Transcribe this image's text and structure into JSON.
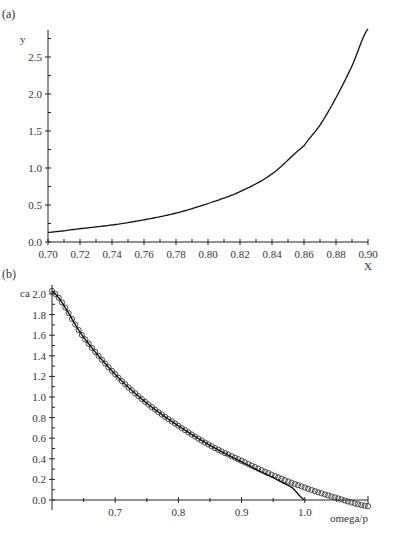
{
  "chart_data": [
    {
      "panel": "(a)",
      "type": "line",
      "title": "",
      "xlabel": "X",
      "ylabel": "y",
      "xlim": [
        0.7,
        0.9
      ],
      "ylim": [
        0.0,
        2.9
      ],
      "xticks": [
        "0.70",
        "0.72",
        "0.74",
        "0.76",
        "0.78",
        "0.80",
        "0.82",
        "0.84",
        "0.86",
        "0.88",
        "0.90"
      ],
      "yticks": [
        "0.0",
        "0.5",
        "1.0",
        "1.5",
        "2.0",
        "2.5"
      ],
      "grid": false,
      "series": [
        {
          "name": "y(X)",
          "style": "solid",
          "x": [
            0.7,
            0.72,
            0.74,
            0.76,
            0.78,
            0.8,
            0.82,
            0.84,
            0.86,
            0.87,
            0.88,
            0.89,
            0.9
          ],
          "values": [
            0.13,
            0.18,
            0.23,
            0.3,
            0.39,
            0.52,
            0.68,
            0.92,
            1.3,
            1.58,
            1.95,
            2.38,
            2.88
          ]
        }
      ]
    },
    {
      "panel": "(b)",
      "type": "line",
      "title": "",
      "xlabel": "omega/p",
      "ylabel": "ca",
      "xlim": [
        0.6,
        1.1
      ],
      "ylim": [
        0.0,
        2.0
      ],
      "xticks": [
        "0.7",
        "0.8",
        "0.9",
        "1.0"
      ],
      "yticks": [
        "0.0",
        "0.2",
        "0.4",
        "0.6",
        "0.8",
        "1.0",
        "1.2",
        "1.4",
        "1.6",
        "1.8",
        "2.0"
      ],
      "grid": false,
      "series": [
        {
          "name": "solid curve",
          "style": "solid",
          "x": [
            0.6,
            0.65,
            0.7,
            0.75,
            0.8,
            0.85,
            0.9,
            0.95,
            0.98,
            1.0
          ],
          "values": [
            2.03,
            1.58,
            1.22,
            0.94,
            0.72,
            0.53,
            0.37,
            0.22,
            0.12,
            0.0
          ]
        },
        {
          "name": "circles",
          "style": "markers-circle",
          "x": [
            0.6,
            0.65,
            0.7,
            0.75,
            0.8,
            0.85,
            0.9,
            0.95,
            1.0,
            1.05,
            1.1
          ],
          "values": [
            2.03,
            1.58,
            1.22,
            0.94,
            0.72,
            0.53,
            0.38,
            0.24,
            0.12,
            0.02,
            -0.06
          ]
        }
      ]
    }
  ]
}
